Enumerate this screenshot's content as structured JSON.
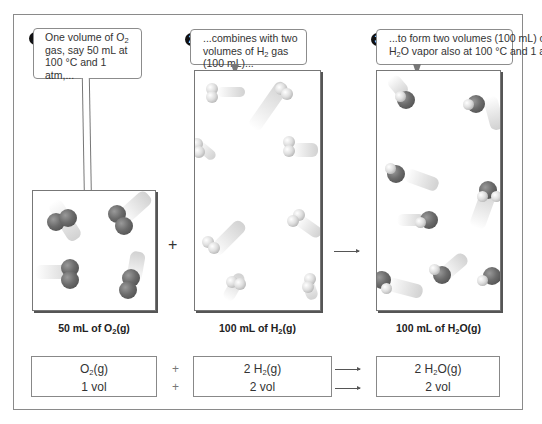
{
  "callouts": [
    {
      "number": "1",
      "line1": "One volume of O",
      "sub1": "2",
      "line2": "gas, say 50 mL at",
      "line3": "100 °C and 1 atm,..."
    },
    {
      "number": "2",
      "line1": "...combines with two",
      "line2a": "volumes of H",
      "sub2": "2",
      "line2b": " gas (100 mL)..."
    },
    {
      "number": "3",
      "line1": "...to form two volumes (100 mL) of",
      "line2a": "H",
      "sub2": "2",
      "line2b": "O vapor also at 100 °C and 1 atm."
    }
  ],
  "containers": [
    {
      "label_pre": "50 mL of O",
      "label_sub": "2",
      "label_post": "(g)",
      "molecule": "O2",
      "count": 4
    },
    {
      "label_pre": "100 mL of H",
      "label_sub": "2",
      "label_post": "(g)",
      "molecule": "H2",
      "count": 8
    },
    {
      "label_pre": "100 mL of H",
      "label_sub": "2",
      "label_post": "O(g)",
      "molecule": "H2O",
      "count": 8
    }
  ],
  "operators": {
    "plus": "+",
    "arrow": "→"
  },
  "equation": {
    "row1": [
      {
        "pre": "O",
        "sub": "2",
        "post": "(g)"
      },
      {
        "pre": "2 H",
        "sub": "2",
        "post": "(g)"
      },
      {
        "pre": "2 H",
        "sub": "2",
        "post": "O(g)"
      }
    ],
    "row2": [
      "1 vol",
      "2 vol",
      "2 vol"
    ],
    "plus": "+"
  },
  "colors": {
    "oxygen": "#6b6b6b",
    "hydrogen": "#e8e8e8",
    "frame": "#8a8a8a"
  }
}
